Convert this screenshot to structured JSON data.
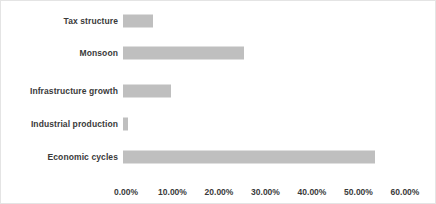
{
  "chart_data": {
    "type": "bar",
    "orientation": "horizontal",
    "title": "",
    "xlabel": "",
    "ylabel": "",
    "categories": [
      "Tax structure",
      "Monsoon",
      "Infrastructure growth",
      "Industrial production",
      "Economic cycles"
    ],
    "values": [
      6.4,
      26.1,
      10.4,
      1.0,
      54.3
    ],
    "value_format": "percent",
    "xlim": [
      0,
      60
    ],
    "xticks": [
      0,
      10,
      20,
      30,
      40,
      50,
      60
    ],
    "xtick_labels": [
      "0.00%",
      "10.00%",
      "20.00%",
      "30.00%",
      "40.00%",
      "50.00%",
      "60.00%"
    ],
    "grid": false,
    "legend": false,
    "bar_color": "#BFBFBF",
    "text_color": "#3A3A3A",
    "background_color": "#FFFFFF",
    "border_color": "#E4E4E4"
  }
}
